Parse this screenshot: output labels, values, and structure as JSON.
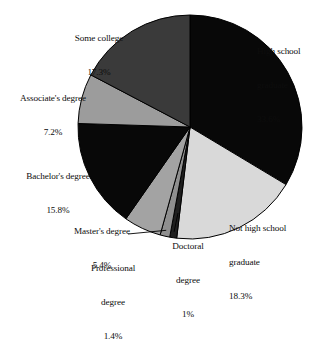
{
  "chart_data": {
    "type": "pie",
    "title": "",
    "subtitle": "",
    "xlabel": "",
    "ylabel": "",
    "legend_position": "none",
    "grid": false,
    "units": "percent",
    "start_angle_deg": 0,
    "direction": "clockwise",
    "categories": [
      "High school graduate",
      "Not high school graduate",
      "Doctoral degree",
      "Professional degree",
      "Master's degree",
      "Bachelor's degree",
      "Associate's degree",
      "Some college"
    ],
    "values": [
      33.6,
      18.3,
      1.0,
      1.4,
      5.4,
      15.8,
      7.2,
      17.3
    ],
    "value_labels": [
      "33.6%",
      "18.3%",
      "1%",
      "1.4%",
      "5.4%",
      "15.8%",
      "7.2%",
      "17.3%"
    ],
    "colors": [
      "#080808",
      "#d9d9d9",
      "#1f1f1f",
      "#8f8f8f",
      "#a3a3a3",
      "#080808",
      "#9c9c9c",
      "#3a3a3a"
    ],
    "slices": [
      {
        "name": "High school graduate",
        "value": 33.6,
        "label_lines": [
          "High school",
          "graduate"
        ],
        "value_label": "33.6%",
        "color": "#080808",
        "start_deg": 0.0,
        "end_deg": 120.96,
        "leader_line": false
      },
      {
        "name": "Not high school graduate",
        "value": 18.3,
        "label_lines": [
          "Not high school",
          "graduate"
        ],
        "value_label": "18.3%",
        "color": "#d9d9d9",
        "start_deg": 120.96,
        "end_deg": 186.84,
        "leader_line": false
      },
      {
        "name": "Doctoral degree",
        "value": 1.0,
        "label_lines": [
          "Doctoral",
          "degree"
        ],
        "value_label": "1%",
        "color": "#1f1f1f",
        "start_deg": 186.84,
        "end_deg": 190.44,
        "leader_line": true
      },
      {
        "name": "Professional degree",
        "value": 1.4,
        "label_lines": [
          "Professional",
          "degree"
        ],
        "value_label": "1.4%",
        "color": "#8f8f8f",
        "start_deg": 190.44,
        "end_deg": 195.48,
        "leader_line": true
      },
      {
        "name": "Master's degree",
        "value": 5.4,
        "label_lines": [
          "Master's degree"
        ],
        "value_label": "5.4%",
        "color": "#a3a3a3",
        "start_deg": 195.48,
        "end_deg": 214.92,
        "leader_line": false
      },
      {
        "name": "Bachelor's degree",
        "value": 15.8,
        "label_lines": [
          "Bachelor's degree"
        ],
        "value_label": "15.8%",
        "color": "#080808",
        "start_deg": 214.92,
        "end_deg": 271.8,
        "leader_line": false
      },
      {
        "name": "Associate's degree",
        "value": 7.2,
        "label_lines": [
          "Associate's degree"
        ],
        "value_label": "7.2%",
        "color": "#9c9c9c",
        "start_deg": 271.8,
        "end_deg": 297.72,
        "leader_line": false
      },
      {
        "name": "Some college",
        "value": 17.3,
        "label_lines": [
          "Some college"
        ],
        "value_label": "17.3%",
        "color": "#3a3a3a",
        "start_deg": 297.72,
        "end_deg": 360.0,
        "leader_line": false
      }
    ],
    "geometry": {
      "center_x": 190,
      "center_y": 127,
      "radius": 112,
      "outline_color": "#000000"
    },
    "label_positions": [
      {
        "key": "high-school-graduate",
        "x": 257,
        "y": 23,
        "align": "ta-left"
      },
      {
        "key": "not-high-school-graduate",
        "x": 229,
        "y": 200,
        "align": "ta-left"
      },
      {
        "key": "doctoral-degree",
        "x": 170,
        "y": 218,
        "align": "ta-center"
      },
      {
        "key": "professional-degree",
        "x": 86,
        "y": 240,
        "align": "ta-center"
      },
      {
        "key": "masters-degree",
        "x": 66,
        "y": 203,
        "align": "ta-center"
      },
      {
        "key": "bachelors-degree",
        "x": 15,
        "y": 148,
        "align": "ta-center"
      },
      {
        "key": "associates-degree",
        "x": 5,
        "y": 70,
        "align": "ta-center"
      },
      {
        "key": "some-college",
        "x": 62,
        "y": 10,
        "align": "ta-center"
      }
    ]
  }
}
